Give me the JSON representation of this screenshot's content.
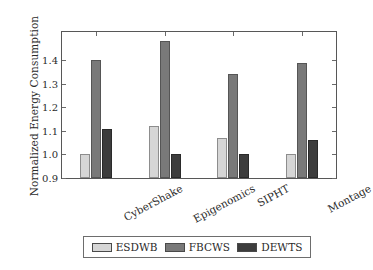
{
  "chart_data": {
    "type": "bar",
    "title": "",
    "xlabel": "",
    "ylabel": "Normalized Energy Consumption",
    "categories": [
      "CyberShake",
      "Epigenomics",
      "SIPHT",
      "Montage"
    ],
    "series": [
      {
        "name": "ESDWB",
        "color": "#d6d6d6",
        "values": [
          1.0,
          1.12,
          1.07,
          1.0
        ]
      },
      {
        "name": "FBCWS",
        "color": "#797979",
        "values": [
          1.4,
          1.48,
          1.34,
          1.39
        ]
      },
      {
        "name": "DEWTS",
        "color": "#3d3d3d",
        "values": [
          1.11,
          1.0,
          1.0,
          1.06
        ]
      }
    ],
    "ylim": [
      0.9,
      1.52
    ],
    "yticks": [
      0.9,
      1.0,
      1.1,
      1.2,
      1.3,
      1.4
    ],
    "ytick_labels": [
      "0.9",
      "1.0",
      "1.1",
      "1.2",
      "1.3",
      "1.4"
    ],
    "grid": false,
    "legend_position": "bottom-center",
    "legend_entries": [
      "ESDWB",
      "FBCWS",
      "DEWTS"
    ]
  }
}
